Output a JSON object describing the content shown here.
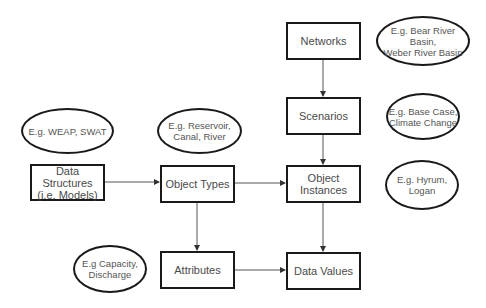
{
  "diagram": {
    "boxes": {
      "networks": "Networks",
      "scenarios": "Scenarios",
      "object_instances": "Object\nInstances",
      "data_values": "Data Values",
      "data_structures": "Data Structures\n(i.e. Models)",
      "object_types": "Object Types",
      "attributes": "Attributes"
    },
    "examples": {
      "networks": "E.g. Bear River Basin,\nWeber River Basin",
      "scenarios": "E.g. Base Case,\nClimate Change",
      "object_instances": "E.g. Hyrum,\nLogan",
      "data_structures": "E.g. WEAP, SWAT",
      "object_types": "E.g. Reservoir,\nCanal, River",
      "attributes": "E.g Capacity,\nDischarge"
    },
    "edges": [
      {
        "from": "Networks",
        "to": "Scenarios"
      },
      {
        "from": "Scenarios",
        "to": "Object Instances"
      },
      {
        "from": "Object Instances",
        "to": "Data Values"
      },
      {
        "from": "Data Structures (i.e. Models)",
        "to": "Object Types"
      },
      {
        "from": "Object Types",
        "to": "Object Instances"
      },
      {
        "from": "Object Types",
        "to": "Attributes"
      },
      {
        "from": "Attributes",
        "to": "Data Values"
      }
    ],
    "colors": {
      "stroke": "#1a1a1a",
      "text": "#4a4a4a",
      "background": "#ffffff"
    }
  }
}
